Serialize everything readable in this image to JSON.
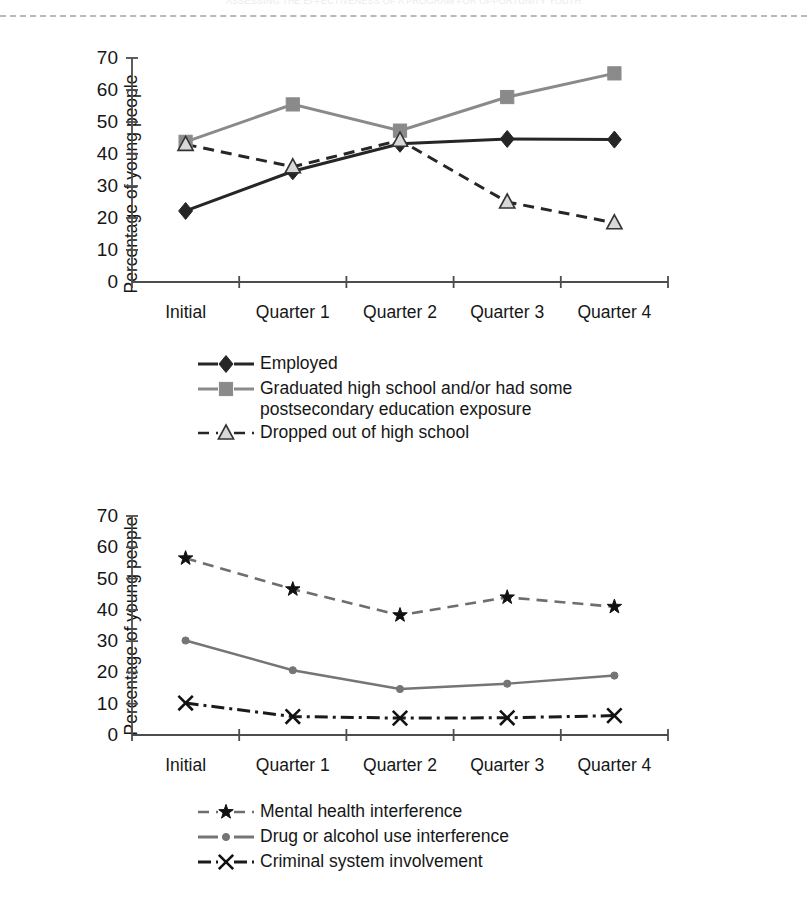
{
  "running_head": "ASSESSING THE EFFECTIVENESS OF A PROGRAM FOR OPPORTUNITY YOUTH",
  "axis": {
    "ylabel": "Percentage of young people",
    "yticks": [
      0,
      10,
      20,
      30,
      40,
      50,
      60,
      70
    ],
    "categories": [
      "Initial",
      "Quarter 1",
      "Quarter 2",
      "Quarter 3",
      "Quarter 4"
    ]
  },
  "colors": {
    "dark": "#262626",
    "gray": "#8a8a8a",
    "axis": "#4d4d4d",
    "rule": "#b9b9bd"
  },
  "chart_data": [
    {
      "type": "line",
      "title": "",
      "xlabel": "",
      "ylabel": "Percentage of young people",
      "ylim": [
        0,
        70
      ],
      "ytick_step": 10,
      "grid": false,
      "legend_position": "below",
      "categories": [
        "Initial",
        "Quarter 1",
        "Quarter 2",
        "Quarter 3",
        "Quarter 4"
      ],
      "series": [
        {
          "name": "Employed",
          "marker": "diamond",
          "linestyle": "solid",
          "color": "#262626",
          "values": [
            22.2,
            34.6,
            43.2,
            44.7,
            44.5
          ]
        },
        {
          "name": "Graduated high school and/or had some postsecondary education exposure",
          "marker": "square",
          "linestyle": "solid",
          "color": "#8a8a8a",
          "values": [
            43.8,
            55.5,
            47.3,
            57.8,
            65.2
          ]
        },
        {
          "name": "Dropped out of high school",
          "marker": "triangle",
          "linestyle": "dashed",
          "color": "#262626",
          "values": [
            43.0,
            36.0,
            44.3,
            25.0,
            18.5
          ]
        }
      ]
    },
    {
      "type": "line",
      "title": "",
      "xlabel": "",
      "ylabel": "Percentage of young people",
      "ylim": [
        0,
        70
      ],
      "ytick_step": 10,
      "grid": false,
      "legend_position": "below",
      "categories": [
        "Initial",
        "Quarter 1",
        "Quarter 2",
        "Quarter 3",
        "Quarter 4"
      ],
      "series": [
        {
          "name": "Mental health interference",
          "marker": "star",
          "linestyle": "dashed",
          "color": "#6e6e6e",
          "values": [
            56.5,
            46.6,
            38.3,
            44.0,
            41.0
          ]
        },
        {
          "name": "Drug or alcohol use interference",
          "marker": "circle",
          "linestyle": "solid",
          "color": "#757575",
          "values": [
            30.2,
            20.7,
            14.7,
            16.4,
            19.0
          ]
        },
        {
          "name": "Criminal system involvement",
          "marker": "x",
          "linestyle": "dashdot",
          "color": "#1a1a1a",
          "values": [
            10.2,
            5.9,
            5.4,
            5.5,
            6.2
          ]
        }
      ]
    }
  ],
  "legend1": [
    {
      "label": "Employed",
      "marker": "diamond",
      "linestyle": "solid",
      "color": "#262626"
    },
    {
      "label": "Graduated high school and/or had some postsecondary education exposure",
      "marker": "square",
      "linestyle": "solid",
      "color": "#8a8a8a"
    },
    {
      "label": "Dropped out of high school",
      "marker": "triangle",
      "linestyle": "dashed",
      "color": "#262626"
    }
  ],
  "legend2": [
    {
      "label": "Mental health interference",
      "marker": "star",
      "linestyle": "dashed",
      "color": "#6e6e6e"
    },
    {
      "label": "Drug or alcohol use interference",
      "marker": "circle",
      "linestyle": "solid",
      "color": "#757575"
    },
    {
      "label": "Criminal system involvement",
      "marker": "x",
      "linestyle": "dashdot",
      "color": "#1a1a1a"
    }
  ]
}
